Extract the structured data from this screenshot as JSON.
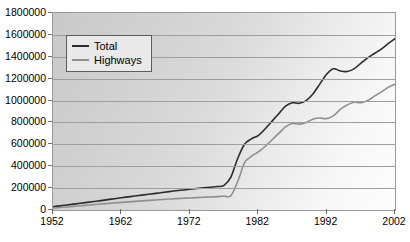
{
  "chart_data": {
    "type": "line",
    "title": "",
    "xlabel": "",
    "ylabel": "",
    "xlim": [
      1952,
      2002
    ],
    "ylim": [
      0,
      1800000
    ],
    "grid": true,
    "legend_position": "top-left-inside",
    "x_tick_labels": [
      "1952",
      "1962",
      "1972",
      "1982",
      "1992",
      "2002"
    ],
    "x_ticks": [
      1952,
      1962,
      1972,
      1982,
      1992,
      2002
    ],
    "y_tick_labels": [
      "0",
      "200000",
      "400000",
      "600000",
      "800000",
      "1000000",
      "1200000",
      "1400000",
      "1600000",
      "1800000"
    ],
    "y_ticks": [
      0,
      200000,
      400000,
      600000,
      800000,
      1000000,
      1200000,
      1400000,
      1600000,
      1800000
    ],
    "x": [
      1952,
      1953,
      1954,
      1955,
      1956,
      1957,
      1958,
      1959,
      1960,
      1961,
      1962,
      1963,
      1964,
      1965,
      1966,
      1967,
      1968,
      1969,
      1970,
      1971,
      1972,
      1973,
      1974,
      1975,
      1976,
      1977,
      1978,
      1979,
      1980,
      1981,
      1982,
      1983,
      1984,
      1985,
      1986,
      1987,
      1988,
      1989,
      1990,
      1991,
      1992,
      1993,
      1994,
      1995,
      1996,
      1997,
      1998,
      1999,
      2000,
      2001,
      2002
    ],
    "series": [
      {
        "name": "Total",
        "color": "#2b2b2b",
        "values": [
          30000,
          38000,
          46000,
          54000,
          62000,
          70000,
          78000,
          86000,
          95000,
          103000,
          112000,
          120000,
          128000,
          136000,
          144000,
          152000,
          160000,
          168000,
          176000,
          183000,
          190000,
          196000,
          202000,
          208000,
          214000,
          225000,
          300000,
          470000,
          600000,
          650000,
          680000,
          740000,
          810000,
          880000,
          950000,
          980000,
          975000,
          1000000,
          1060000,
          1150000,
          1240000,
          1290000,
          1270000,
          1265000,
          1290000,
          1340000,
          1390000,
          1430000,
          1470000,
          1520000,
          1565000
        ]
      },
      {
        "name": "Highways",
        "color": "#8f8f8f",
        "values": [
          18000,
          23000,
          28000,
          33000,
          39000,
          44000,
          49000,
          55000,
          60000,
          65000,
          70000,
          74000,
          79000,
          83000,
          88000,
          92000,
          96000,
          100000,
          104000,
          107000,
          110000,
          113000,
          116000,
          119000,
          122000,
          128000,
          130000,
          260000,
          430000,
          490000,
          530000,
          580000,
          640000,
          700000,
          760000,
          790000,
          785000,
          800000,
          830000,
          840000,
          835000,
          860000,
          920000,
          960000,
          985000,
          980000,
          1000000,
          1040000,
          1080000,
          1120000,
          1150000
        ]
      }
    ]
  },
  "legend": {
    "entries": [
      {
        "label": "Total"
      },
      {
        "label": "Highways"
      }
    ]
  }
}
